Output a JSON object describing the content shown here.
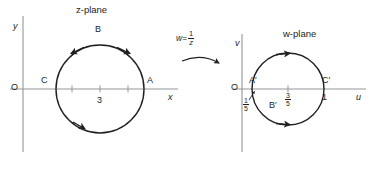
{
  "figure": {
    "type": "complex-plane-mapping-diagram",
    "background_color": "#ffffff",
    "ink_color": "#231f20",
    "axis_color": "#808285"
  },
  "transform": {
    "lhs": "w",
    "equals": "=",
    "numerator": "1",
    "denominator": "z",
    "full_text": "w = 1/z",
    "arrow_name": "mapping-arrow"
  },
  "z_plane": {
    "title": "z-plane",
    "origin_label": "O",
    "x_axis_label": "x",
    "y_axis_label": "y",
    "tick_label": "3",
    "ticks": [
      "",
      "3",
      ""
    ],
    "points": [
      {
        "id": "A",
        "label": "A",
        "position": "right"
      },
      {
        "id": "B",
        "label": "B",
        "position": "top"
      },
      {
        "id": "C",
        "label": "C",
        "position": "left"
      }
    ],
    "circle": {
      "center_x": 3,
      "radius": 2,
      "orientation": "clockwise",
      "arrow_count": 3
    }
  },
  "w_plane": {
    "title": "w-plane",
    "origin_label": "O",
    "u_axis_label": "u",
    "v_axis_label": "v",
    "tick_label_center_num": "3",
    "tick_label_center_den": "5",
    "tick_label_center": "3/5",
    "left_intercept_num": "1",
    "left_intercept_den": "5",
    "left_intercept": "1/5",
    "right_intercept": "1",
    "points": [
      {
        "id": "A-prime",
        "label": "A′",
        "position": "left"
      },
      {
        "id": "B-prime",
        "label": "B′",
        "position": "inside-lower-left"
      },
      {
        "id": "C-prime",
        "label": "C′",
        "position": "right"
      }
    ],
    "circle": {
      "orientation": "clockwise",
      "arrow_count": 2
    }
  }
}
